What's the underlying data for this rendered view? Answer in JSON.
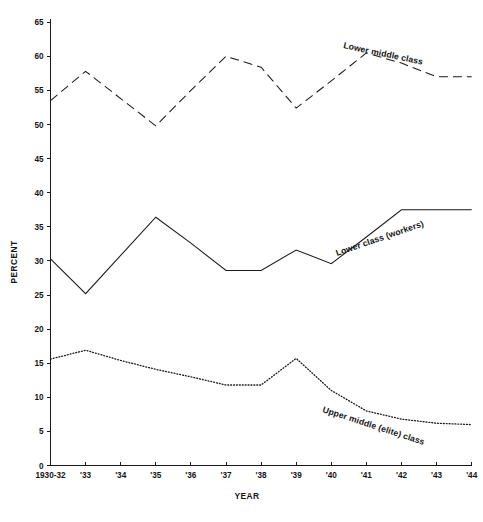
{
  "chart_data": {
    "type": "line",
    "title": "",
    "xlabel": "YEAR",
    "ylabel": "PERCENT",
    "xlim": [
      0,
      12
    ],
    "ylim": [
      0,
      65
    ],
    "ytick_step": 5,
    "grid": false,
    "legend_position": "inline-labels",
    "categories": [
      "1930-32",
      "'33",
      "'34",
      "'35",
      "'36",
      "'37",
      "'38",
      "'39",
      "'40",
      "'41",
      "'42",
      "'43",
      "'44"
    ],
    "series": [
      {
        "name": "Lower middle class",
        "style": "dashed",
        "values": [
          53.5,
          57.8,
          53.8,
          49.8,
          55.0,
          60.0,
          58.4,
          52.4,
          56.4,
          60.5,
          59.0,
          57.0,
          57.0
        ]
      },
      {
        "name": "Lower class (workers)",
        "style": "solid",
        "values": [
          30.3,
          25.2,
          30.8,
          36.4,
          32.6,
          28.6,
          28.6,
          31.6,
          29.6,
          33.5,
          37.5,
          37.5,
          37.5
        ]
      },
      {
        "name": "Upper middle (elite) class",
        "style": "dotted",
        "values": [
          15.6,
          16.9,
          15.4,
          14.1,
          13.0,
          11.8,
          11.8,
          15.7,
          11.0,
          8.0,
          6.8,
          6.2,
          6.0
        ]
      }
    ],
    "ytick_labels": [
      "0",
      "5",
      "10",
      "15",
      "20",
      "25",
      "30",
      "35",
      "40",
      "45",
      "50",
      "55",
      "60",
      "65"
    ],
    "series_label_text": {
      "lower_middle_class": "Lower middle class",
      "lower_class_workers": "Lower class (workers)",
      "upper_middle_elite_class": "Upper middle (elite) class"
    },
    "colors": {
      "axis": "#1a1a1a",
      "ink": "#141414",
      "background": "#ffffff"
    }
  }
}
